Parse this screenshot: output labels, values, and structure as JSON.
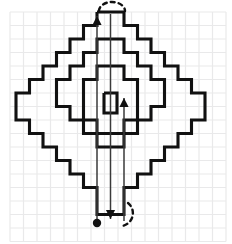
{
  "figure": {
    "background_color": "#ffffff",
    "grid": {
      "line_color": "#e9e9ea",
      "cell_size": 13.5,
      "origin_x": 10,
      "origin_y": 12,
      "columns": 16,
      "rows": 17
    },
    "path": {
      "stroke_color": "#111111",
      "stroke_width": 3.1,
      "description": "Nested rectilinear staircase diamonds, six concentric rings plus a small center cell",
      "rings": [
        {
          "name": "ring-outer-1",
          "points": "97,12 124,12 124,25.5 137.5,25.5 137.5,39 151,39 151,52.5 164.5,52.5 164.5,66 178,66 178,79.5 191.5,79.5 191.5,93 205,93 205,120 191.5,120 191.5,133.5 178,133.5 178,147 164.5,147 164.5,160.5 151,160.5 151,174 137.5,174 137.5,187.5 124,187.5 124,214.5 110.5,214.5"
        },
        {
          "name": "ring-outer-1-mirror",
          "points": "97,12 97,25.5 83.5,25.5 83.5,39 70,39 70,52.5 56.5,52.5 56.5,66 43,66 43,79.5 29.5,79.5 29.5,93 16,93 16,120 29.5,120 29.5,133.5 43,133.5 43,147 56.5,147 56.5,160.5 70,160.5 70,174 83.5,174 83.5,187.5 97,187.5 97,214.5 110.5,214.5"
        },
        {
          "name": "ring-2",
          "points": "110.5,39 124,39 124,52.5 137.5,52.5 137.5,66 151,66 151,79.5 164.5,79.5 164.5,106.5 151,106.5 151,120 137.5,120 137.5,133.5 124,133.5 124,147 110.5,147"
        },
        {
          "name": "ring-2-mirror",
          "points": "110.5,39 97,39 97,52.5 83.5,52.5 83.5,66 70,66 70,79.5 56.5,79.5 56.5,106.5 70,106.5 70,120 83.5,120 83.5,133.5 97,133.5 97,147 110.5,147"
        },
        {
          "name": "ring-3",
          "points": "110.5,66 124,66 124,79.5 137.5,79.5 137.5,120 124,120 124,133.5 110.5,133.5"
        },
        {
          "name": "ring-3-mirror",
          "points": "110.5,66 97,66 97,79.5 83.5,79.5 83.5,120 97,120 97,133.5 110.5,133.5"
        },
        {
          "name": "ring-center-cell",
          "points": "104,93 117,93 117,113 104,113 104,93"
        }
      ]
    },
    "annotations": [
      {
        "name": "arrow-up-left",
        "type": "arrow",
        "direction": "up",
        "from_x": 97,
        "from_y": 221,
        "to_x": 97,
        "to_y": 16,
        "color": "#3a3a3a"
      },
      {
        "name": "arrow-down-center",
        "type": "arrow",
        "direction": "down",
        "from_x": 110.5,
        "from_y": 14,
        "to_x": 110.5,
        "to_y": 219,
        "color": "#3a3a3a"
      },
      {
        "name": "arrow-up-right",
        "type": "arrow",
        "direction": "up",
        "from_x": 124,
        "from_y": 221,
        "to_x": 124,
        "to_y": 98,
        "color": "#3a3a3a"
      },
      {
        "name": "start-dot",
        "type": "dot",
        "x": 97,
        "y": 223,
        "radius": 4.2,
        "color": "#111111"
      },
      {
        "name": "dashed-arc-top",
        "type": "dashed-arc",
        "position": "top",
        "color": "#111111"
      },
      {
        "name": "dashed-arc-bottom",
        "type": "dashed-arc",
        "position": "bottom-right",
        "color": "#111111"
      }
    ]
  }
}
